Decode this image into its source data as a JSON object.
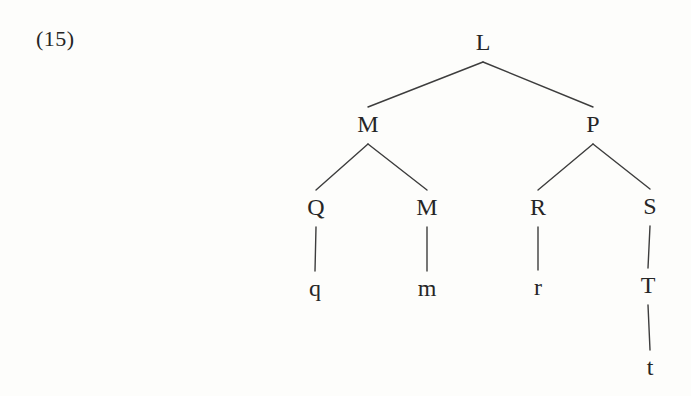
{
  "figure_label": "(15)",
  "colors": {
    "ink": "#262626",
    "edge": "#3d3d3d",
    "background": "#fdfdfb"
  },
  "tree": {
    "nodes": [
      {
        "id": "L",
        "label": "L",
        "x": 483,
        "y": 42
      },
      {
        "id": "M1",
        "label": "M",
        "x": 368,
        "y": 124
      },
      {
        "id": "P",
        "label": "P",
        "x": 593,
        "y": 124
      },
      {
        "id": "Q",
        "label": "Q",
        "x": 316,
        "y": 207
      },
      {
        "id": "M2",
        "label": "M",
        "x": 427,
        "y": 207
      },
      {
        "id": "R",
        "label": "R",
        "x": 538,
        "y": 207
      },
      {
        "id": "S",
        "label": "S",
        "x": 650,
        "y": 206
      },
      {
        "id": "q",
        "label": "q",
        "x": 315,
        "y": 288
      },
      {
        "id": "m",
        "label": "m",
        "x": 427,
        "y": 288
      },
      {
        "id": "r",
        "label": "r",
        "x": 538,
        "y": 287
      },
      {
        "id": "T",
        "label": "T",
        "x": 648,
        "y": 285
      },
      {
        "id": "t",
        "label": "t",
        "x": 650,
        "y": 367
      }
    ],
    "edges": [
      {
        "from": "L",
        "to": "M1"
      },
      {
        "from": "L",
        "to": "P"
      },
      {
        "from": "M1",
        "to": "Q"
      },
      {
        "from": "M1",
        "to": "M2"
      },
      {
        "from": "P",
        "to": "R"
      },
      {
        "from": "P",
        "to": "S"
      },
      {
        "from": "Q",
        "to": "q"
      },
      {
        "from": "M2",
        "to": "m"
      },
      {
        "from": "R",
        "to": "r"
      },
      {
        "from": "S",
        "to": "T"
      },
      {
        "from": "T",
        "to": "t"
      }
    ]
  }
}
